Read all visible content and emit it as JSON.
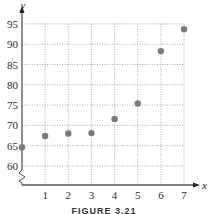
{
  "figure": {
    "caption": "FIGURE 3.21"
  },
  "colors": {
    "axis": "#555555",
    "grid": "#aaaaaa",
    "point": "#7a7a7a",
    "text": "#2a2a2a"
  },
  "chart_data": {
    "type": "scatter",
    "title": "",
    "xlabel": "x",
    "ylabel": "y",
    "x": [
      0,
      1,
      2,
      3,
      4,
      5,
      6,
      7
    ],
    "y": [
      64.6,
      67.4,
      68.0,
      68.1,
      71.6,
      75.4,
      88.3,
      93.7
    ],
    "xlim": [
      0,
      7
    ],
    "ylim": [
      60,
      95
    ],
    "x_ticks": [
      1,
      2,
      3,
      4,
      5,
      6,
      7
    ],
    "y_ticks": [
      60,
      65,
      70,
      75,
      80,
      85,
      90,
      95
    ],
    "grid": true,
    "grid_style": "dotted",
    "y_axis_break": true,
    "legend": null
  }
}
